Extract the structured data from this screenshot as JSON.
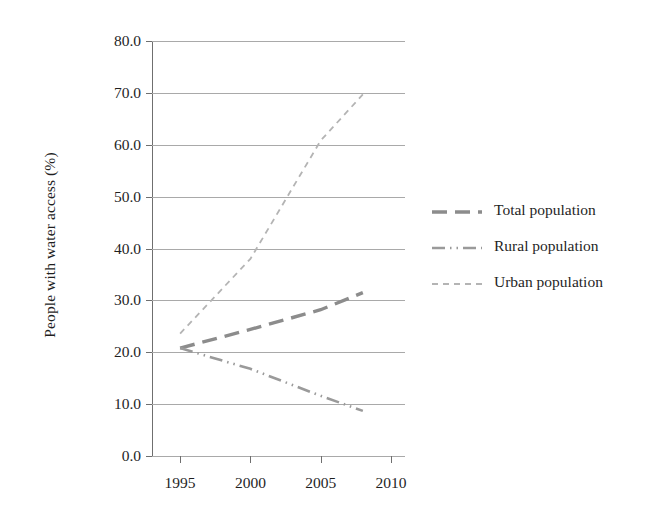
{
  "chart_data": {
    "type": "line",
    "title": "",
    "xlabel": "",
    "ylabel": "People with water access (%)",
    "x": [
      1995,
      2000,
      2005,
      2008
    ],
    "xtick_labels": [
      "1995",
      "2000",
      "2005",
      "2010"
    ],
    "xticks": [
      1995,
      2000,
      2005,
      2010
    ],
    "xlim": [
      1993,
      2011
    ],
    "ylim": [
      0.0,
      80.0
    ],
    "yticks": [
      0.0,
      10.0,
      20.0,
      30.0,
      40.0,
      50.0,
      60.0,
      70.0,
      80.0
    ],
    "ytick_labels": [
      "0.0",
      "10.0",
      "20.0",
      "30.0",
      "40.0",
      "50.0",
      "60.0",
      "70.0",
      "80.0"
    ],
    "grid": "horizontal",
    "legend_position": "right",
    "series": [
      {
        "name": "Total population",
        "dash": "long-dash",
        "color": "#8c8c8c",
        "values": [
          20.8,
          24.4,
          28.2,
          31.5
        ]
      },
      {
        "name": "Rural population",
        "dash": "dash-dot-dot",
        "color": "#9a9a9a",
        "values": [
          20.8,
          16.8,
          11.6,
          8.7
        ]
      },
      {
        "name": "Urban population",
        "dash": "short-dash",
        "color": "#b4b4b4",
        "values": [
          23.6,
          38.0,
          60.8,
          69.7
        ]
      }
    ]
  },
  "axes": {
    "y_title": "People with water access (%)",
    "y_tick_labels": [
      "80.0",
      "70.0",
      "60.0",
      "50.0",
      "40.0",
      "30.0",
      "20.0",
      "10.0",
      "0.0"
    ],
    "x_tick_labels": [
      "1995",
      "2000",
      "2005",
      "2010"
    ]
  },
  "legend": {
    "items": [
      {
        "label": "Total population"
      },
      {
        "label": "Rural population"
      },
      {
        "label": "Urban population"
      }
    ]
  }
}
